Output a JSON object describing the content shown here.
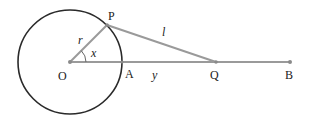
{
  "diagram": {
    "colors": {
      "circle": "#2a2a2a",
      "segments": "#9a9a9a",
      "points": "#8a8a8a",
      "text": "#222222"
    },
    "points": {
      "O": {
        "label": "O",
        "x": 70,
        "y": 62
      },
      "P": {
        "label": "P",
        "x": 107,
        "y": 25
      },
      "A": {
        "label": "A",
        "x": 122,
        "y": 62
      },
      "Q": {
        "label": "Q",
        "x": 216,
        "y": 62
      },
      "B": {
        "label": "B",
        "x": 290,
        "y": 62
      }
    },
    "circle": {
      "center": "O",
      "radius": 52
    },
    "segments": [
      {
        "from": "O",
        "to": "P",
        "label": "r"
      },
      {
        "from": "P",
        "to": "Q",
        "label": "l"
      },
      {
        "from": "O",
        "to": "B",
        "label": ""
      }
    ],
    "labels": {
      "r": "r",
      "x": "x",
      "l": "l",
      "y": "y",
      "O": "O",
      "P": "P",
      "A": "A",
      "Q": "Q",
      "B": "B"
    }
  }
}
